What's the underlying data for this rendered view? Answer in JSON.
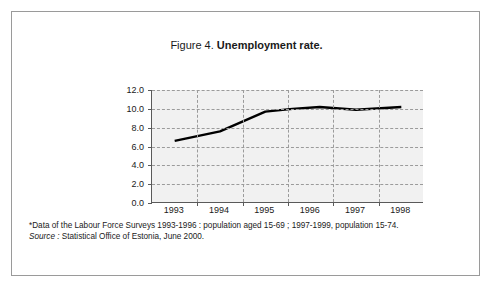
{
  "figure": {
    "label": "Figure 4.",
    "name": "Unemployment rate."
  },
  "footnotes": {
    "data_note": "*Data of the Labour Force Surveys 1993-1996 : population aged 15-69 ; 1997-1999, population 15-74.",
    "source_label": "Source :",
    "source_text": "Statistical Office of Estonia, June 2000."
  },
  "colors": {
    "plot_background": "#f1f1f1",
    "gridline": "#9b9b9b",
    "axis": "#5a5a5a",
    "series": "#000000",
    "frame": "#9a9a9a",
    "text": "#1a1a1a"
  },
  "chart_data": {
    "type": "line",
    "title": "Figure 4. Unemployment rate.",
    "xlabel": "",
    "ylabel": "",
    "x": [
      1993,
      1994,
      1995,
      1996,
      1997,
      1998
    ],
    "categories": [
      "1993",
      "1994",
      "1995",
      "1996",
      "1997",
      "1998"
    ],
    "series": [
      {
        "name": "Unemployment rate",
        "values": [
          6.6,
          7.6,
          9.7,
          10.0,
          9.9,
          10.2
        ]
      }
    ],
    "detail_points": [
      {
        "x": 1993.0,
        "y": 6.6
      },
      {
        "x": 1994.0,
        "y": 7.6
      },
      {
        "x": 1995.0,
        "y": 9.7
      },
      {
        "x": 1995.6,
        "y": 10.0
      },
      {
        "x": 1996.2,
        "y": 10.2
      },
      {
        "x": 1997.0,
        "y": 9.9
      },
      {
        "x": 1998.0,
        "y": 10.2
      }
    ],
    "ylim": [
      0.0,
      12.0
    ],
    "ytick_values": [
      12.0,
      10.0,
      8.0,
      6.0,
      4.0,
      2.0,
      0.0
    ],
    "ytick_labels": [
      "12.0",
      "10.0",
      "8.0",
      "6.0",
      "4.0",
      "2.0",
      "0.0"
    ],
    "xtick_labels": [
      "1993",
      "1994",
      "1995",
      "1996",
      "1997",
      "1998"
    ],
    "grid": true,
    "grid_style": "dashed",
    "legend": false,
    "legend_position": "none"
  }
}
